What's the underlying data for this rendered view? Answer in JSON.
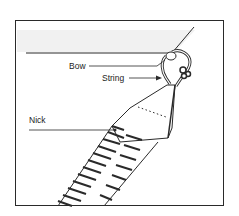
{
  "diagram": {
    "labels": {
      "bow": "Bow",
      "string": "String",
      "nick": "Nick"
    },
    "colors": {
      "line": "#2a2a2a",
      "fill": "#ffffff",
      "shade": "#ececec"
    }
  }
}
